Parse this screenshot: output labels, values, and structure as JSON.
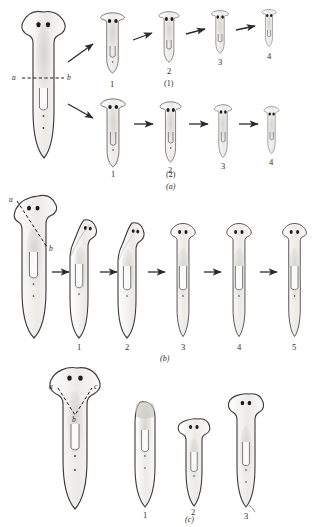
{
  "figure": {
    "colors": {
      "ink": "#2a2a2a",
      "outline": "#3b3b3b",
      "fill": "#f4f3f1",
      "shade": "#d8d6d2",
      "eye": "#1a1a1a",
      "background": "#ffffff"
    }
  },
  "panels": [
    {
      "id": "a",
      "label": "(a)",
      "rows": [
        {
          "id": "row1",
          "label": "(1)",
          "stage_numbers": [
            "1",
            "2",
            "3",
            "4"
          ]
        },
        {
          "id": "row2",
          "label": "(2)",
          "stage_numbers": [
            "1",
            "2",
            "3",
            "4"
          ]
        }
      ],
      "cut": {
        "type": "transverse-dashed",
        "endpoints": [
          "a",
          "b"
        ]
      }
    },
    {
      "id": "b",
      "label": "(b)",
      "stage_numbers": [
        "1",
        "2",
        "3",
        "4",
        "5"
      ],
      "cut": {
        "type": "oblique-dashed",
        "endpoints": [
          "a",
          "b"
        ]
      }
    },
    {
      "id": "c",
      "label": "(c)",
      "stage_numbers": [
        "1",
        "2",
        "3"
      ],
      "cut": {
        "type": "v-shaped-dashed",
        "endpoints": [
          "a",
          "b",
          "c"
        ]
      }
    }
  ],
  "cut_labels": {
    "a": "a",
    "b": "b",
    "c": "c"
  }
}
